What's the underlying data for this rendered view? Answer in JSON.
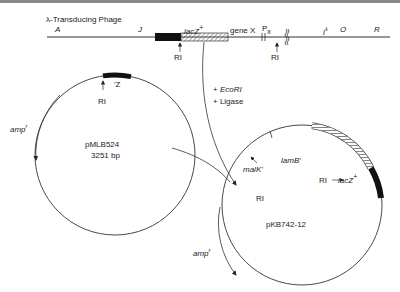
{
  "phage": {
    "title": "λ-Transducing Phage",
    "gene_labels": {
      "A": "A",
      "J": "J",
      "lacZ": "lacZ",
      "lacZ_sup": "+",
      "geneX": "gene X",
      "Px": "P",
      "Px_sub": "x",
      "i": "i",
      "i_sup": "λ",
      "O": "O",
      "R": "R"
    },
    "sites": [
      "RI",
      "RI"
    ]
  },
  "reaction": {
    "line1_prefix": "+ ",
    "line1_enzyme": "EcoRI",
    "line2": "+ Ligase"
  },
  "plasmid_left": {
    "name": "pMLB524",
    "size": "3251 bp",
    "insert_label": "'Z",
    "site": "RI",
    "resistance": "amp",
    "resistance_sup": "r"
  },
  "plasmid_right": {
    "name": "pKB742-12",
    "labels": {
      "malK": "malK'",
      "lamB": "lamB'",
      "lacZ": "lacZ",
      "lacZ_sup": "+"
    },
    "sites": [
      "RI",
      "RI"
    ],
    "resistance": "amp",
    "resistance_sup": "r"
  },
  "colors": {
    "line": "#2a2a2a",
    "fill_black": "#111111",
    "hatch": "#555555"
  }
}
